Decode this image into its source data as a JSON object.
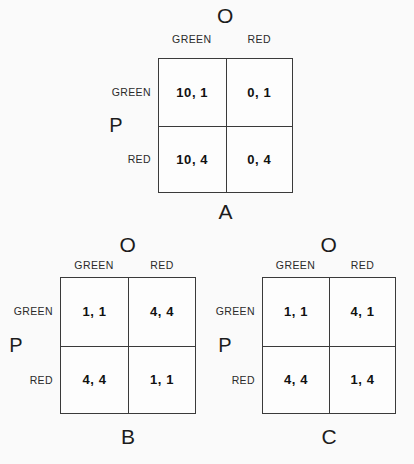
{
  "background_color": "#fafafa",
  "line_color": "#3a3a3a",
  "text_color": "#1c1c1c",
  "labels": {
    "column_player": "O",
    "row_player": "P",
    "strategy_green": "GREEN",
    "strategy_red": "RED"
  },
  "matrices": [
    {
      "caption": "A",
      "column_player": "O",
      "row_player": "P",
      "column_headers": [
        "GREEN",
        "RED"
      ],
      "row_headers": [
        "GREEN",
        "RED"
      ],
      "cells": [
        [
          "10, 1",
          "0, 1"
        ],
        [
          "10, 4",
          "0, 4"
        ]
      ]
    },
    {
      "caption": "B",
      "column_player": "O",
      "row_player": "P",
      "column_headers": [
        "GREEN",
        "RED"
      ],
      "row_headers": [
        "GREEN",
        "RED"
      ],
      "cells": [
        [
          "1, 1",
          "4, 4"
        ],
        [
          "4, 4",
          "1, 1"
        ]
      ]
    },
    {
      "caption": "C",
      "column_player": "O",
      "row_player": "P",
      "column_headers": [
        "GREEN",
        "RED"
      ],
      "row_headers": [
        "GREEN",
        "RED"
      ],
      "cells": [
        [
          "1, 1",
          "4, 1"
        ],
        [
          "4, 4",
          "1, 4"
        ]
      ]
    }
  ]
}
